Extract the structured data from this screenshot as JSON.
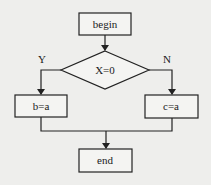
{
  "diagram": {
    "type": "flowchart",
    "nodes": {
      "begin": {
        "label": "begin",
        "shape": "rectangle"
      },
      "decision": {
        "label": "X=0",
        "shape": "diamond"
      },
      "assign_b": {
        "label": "b=a",
        "shape": "rectangle"
      },
      "assign_c": {
        "label": "c=a",
        "shape": "rectangle"
      },
      "end": {
        "label": "end",
        "shape": "rectangle"
      }
    },
    "edge_labels": {
      "yes": "Y",
      "no": "N"
    },
    "edges": [
      {
        "from": "begin",
        "to": "decision"
      },
      {
        "from": "decision",
        "to": "assign_b",
        "label": "Y"
      },
      {
        "from": "decision",
        "to": "assign_c",
        "label": "N"
      },
      {
        "from": "assign_b",
        "to": "end"
      },
      {
        "from": "assign_c",
        "to": "end"
      }
    ]
  }
}
